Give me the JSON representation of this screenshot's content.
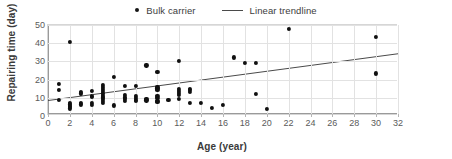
{
  "chart_data": {
    "type": "scatter",
    "title": "",
    "xlabel": "Age (year)",
    "ylabel": "Repairing time (day)",
    "xlim": [
      0,
      32
    ],
    "ylim": [
      0,
      50
    ],
    "xticks": [
      0,
      2,
      4,
      6,
      8,
      10,
      12,
      14,
      16,
      18,
      20,
      22,
      24,
      26,
      28,
      30,
      32
    ],
    "yticks": [
      0,
      10,
      20,
      30,
      40,
      50
    ],
    "grid": true,
    "legend_position": "top-center",
    "legend": [
      {
        "label": "Bulk carrier",
        "marker": "dot",
        "color": "#101010"
      },
      {
        "label": "Linear trendline",
        "marker": "line",
        "color": "#4a4a4a"
      }
    ],
    "series": [
      {
        "name": "Bulk carrier",
        "type": "scatter",
        "marker_color": "#101010",
        "points": [
          [
            1,
            17.6
          ],
          [
            1,
            14.2
          ],
          [
            1,
            8.8
          ],
          [
            2,
            40.8
          ],
          [
            2,
            7.2
          ],
          [
            2,
            6.4
          ],
          [
            2,
            5.6
          ],
          [
            2,
            4.9
          ],
          [
            2,
            4.2
          ],
          [
            3,
            13.2
          ],
          [
            3,
            12.4
          ],
          [
            3,
            7.2
          ],
          [
            3,
            6.4
          ],
          [
            4,
            13.6
          ],
          [
            4,
            11.2
          ],
          [
            4,
            10.4
          ],
          [
            4,
            7.0
          ],
          [
            4,
            6.3
          ],
          [
            5,
            17.2
          ],
          [
            5,
            16.2
          ],
          [
            5,
            15.0
          ],
          [
            5,
            13.6
          ],
          [
            5,
            12.4
          ],
          [
            5,
            11.2
          ],
          [
            5,
            10.2
          ],
          [
            5,
            9.2
          ],
          [
            5,
            8.2
          ],
          [
            5,
            7.2
          ],
          [
            6,
            21.4
          ],
          [
            6,
            5.8
          ],
          [
            7,
            16.4
          ],
          [
            7,
            11.4
          ],
          [
            7,
            10.2
          ],
          [
            7,
            9.2
          ],
          [
            7,
            8.2
          ],
          [
            8,
            16.5
          ],
          [
            8,
            11.0
          ],
          [
            8,
            10.0
          ],
          [
            8,
            9.0
          ],
          [
            8,
            8.4
          ],
          [
            9,
            27.8
          ],
          [
            9,
            9.6
          ],
          [
            9,
            8.6
          ],
          [
            10,
            24.4
          ],
          [
            10,
            16.2
          ],
          [
            10,
            15.2
          ],
          [
            10,
            14.2
          ],
          [
            10,
            11.0
          ],
          [
            10,
            9.8
          ],
          [
            10,
            8.4
          ],
          [
            10,
            7.6
          ],
          [
            11,
            8.8
          ],
          [
            12,
            30.4
          ],
          [
            12,
            15.0
          ],
          [
            12,
            14.0
          ],
          [
            12,
            12.8
          ],
          [
            12,
            11.4
          ],
          [
            12,
            9.6
          ],
          [
            13,
            15.0
          ],
          [
            13,
            14.2
          ],
          [
            13,
            13.4
          ],
          [
            13,
            7.4
          ],
          [
            14,
            7.4
          ],
          [
            15,
            4.6
          ],
          [
            16,
            6.2
          ],
          [
            17,
            32.2
          ],
          [
            18,
            29.2
          ],
          [
            19,
            29.2
          ],
          [
            19,
            12.2
          ],
          [
            20,
            4.0
          ],
          [
            22,
            48.0
          ],
          [
            30,
            43.4
          ],
          [
            30,
            23.4
          ]
        ]
      }
    ],
    "trendline": {
      "name": "Linear trendline",
      "color": "#4a4a4a",
      "x_start": 0,
      "y_start": 8.5,
      "x_end": 32,
      "y_end": 34.2
    }
  }
}
